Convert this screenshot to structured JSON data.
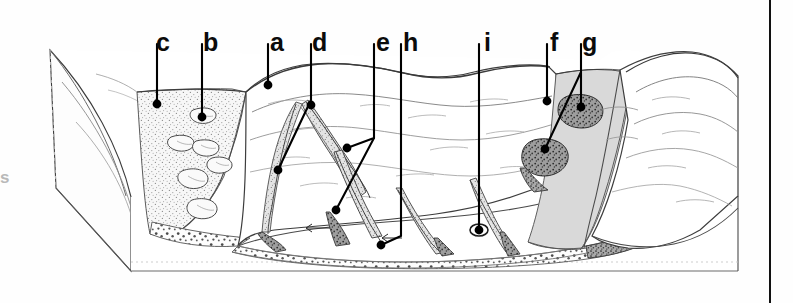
{
  "figure": {
    "kind": "geomorphology-block-diagram",
    "background_color": "#ffffff",
    "ink_color": "#1a1a1a",
    "talus_fill": "#f2f2f2",
    "snowfield_fill": "#d9d9d9",
    "debris_fill": "#8f8f8f",
    "leader_color": "#000000"
  },
  "edge_fragment": {
    "text": "s"
  },
  "rule": {
    "color": "#111111"
  },
  "labels": [
    {
      "key": "c",
      "text": "c",
      "x": 156,
      "y": 30,
      "line_x": 152,
      "dot_x": 157,
      "dot_y": 104
    },
    {
      "key": "b",
      "text": "b",
      "x": 203,
      "y": 30,
      "line_x": 199,
      "dot_x": 202,
      "dot_y": 117
    },
    {
      "key": "a",
      "text": "a",
      "x": 270,
      "y": 30,
      "line_x": 266,
      "dot_x": 268,
      "dot_y": 85
    },
    {
      "key": "d",
      "text": "d",
      "x": 311,
      "y": 30,
      "line_x": 307,
      "dot_x": 278,
      "dot_y": 170
    },
    {
      "key": "e",
      "text": "e",
      "x": 376,
      "y": 30,
      "line_x": 372,
      "dot_x": 347,
      "dot_y": 148
    },
    {
      "key": "h",
      "text": "h",
      "x": 402,
      "y": 30,
      "line_x": 398,
      "dot_x": 381,
      "dot_y": 245
    },
    {
      "key": "i",
      "text": "i",
      "x": 486,
      "y": 30,
      "line_x": 482,
      "dot_x": 479,
      "dot_y": 230
    },
    {
      "key": "f",
      "text": "f",
      "x": 551,
      "y": 30,
      "line_x": 547,
      "dot_x": 547,
      "dot_y": 101
    },
    {
      "key": "g",
      "text": "g",
      "x": 581,
      "y": 30,
      "line_x": 578,
      "dot_x": 581,
      "dot_y": 107
    }
  ],
  "features": {
    "talus_slope": "c",
    "boulders": "b",
    "valley_wall": "a",
    "gully_head": "d",
    "avalanche_chute": "e",
    "valley_floor_deposit": "h",
    "valley_floor_marker": "i",
    "snowfield": "f",
    "debris_cone": "g"
  }
}
